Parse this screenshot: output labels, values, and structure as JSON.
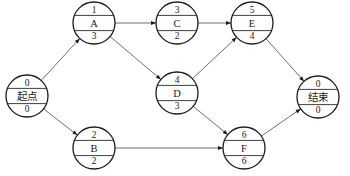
{
  "diagram": {
    "type": "activity-on-node network",
    "nodes": [
      {
        "id": "start",
        "label": "起点",
        "top": "0",
        "bottom": "0",
        "cx": 27,
        "cy": 96,
        "r": 21
      },
      {
        "id": "A",
        "label": "A",
        "top": "1",
        "bottom": "3",
        "cx": 94,
        "cy": 23,
        "r": 21
      },
      {
        "id": "C",
        "label": "C",
        "top": "3",
        "bottom": "2",
        "cx": 177,
        "cy": 23,
        "r": 21
      },
      {
        "id": "E",
        "label": "E",
        "top": "5",
        "bottom": "4",
        "cx": 252,
        "cy": 23,
        "r": 21
      },
      {
        "id": "D",
        "label": "D",
        "top": "4",
        "bottom": "3",
        "cx": 177,
        "cy": 93,
        "r": 21
      },
      {
        "id": "B",
        "label": "B",
        "top": "2",
        "bottom": "2",
        "cx": 94,
        "cy": 148,
        "r": 21
      },
      {
        "id": "F",
        "label": "F",
        "top": "6",
        "bottom": "6",
        "cx": 244,
        "cy": 148,
        "r": 21
      },
      {
        "id": "end",
        "label": "结束",
        "top": "0",
        "bottom": "0",
        "cx": 318,
        "cy": 97,
        "r": 21
      }
    ],
    "edges": [
      {
        "from": "start",
        "to": "A"
      },
      {
        "from": "start",
        "to": "B"
      },
      {
        "from": "A",
        "to": "C"
      },
      {
        "from": "A",
        "to": "D"
      },
      {
        "from": "C",
        "to": "E"
      },
      {
        "from": "D",
        "to": "E"
      },
      {
        "from": "D",
        "to": "F"
      },
      {
        "from": "B",
        "to": "F"
      },
      {
        "from": "E",
        "to": "end"
      },
      {
        "from": "F",
        "to": "end"
      }
    ]
  }
}
